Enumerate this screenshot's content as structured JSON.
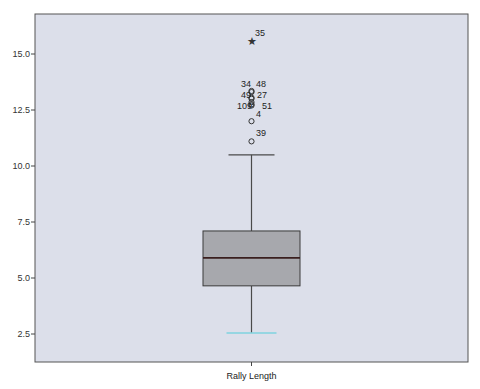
{
  "chart_data": {
    "type": "boxplot",
    "title": "",
    "xlabel": "",
    "ylabel": "",
    "categories": [
      "Rally Length"
    ],
    "ylim": [
      1.3,
      16.9
    ],
    "yticks": [
      2.5,
      5.0,
      7.5,
      10.0,
      12.5,
      15.0
    ],
    "ytick_labels": [
      "2.5",
      "5.0",
      "7.5",
      "10.0",
      "12.5",
      "15.0"
    ],
    "grid": false,
    "legend": null,
    "series": [
      {
        "name": "Rally Length",
        "whisker_low": 2.55,
        "q1": 4.65,
        "median": 5.9,
        "q3": 7.1,
        "whisker_high": 10.5,
        "outliers": [
          {
            "case": "39",
            "value": 11.1,
            "marker": "circle"
          },
          {
            "case": "4",
            "value": 12.0,
            "marker": "circle"
          },
          {
            "case": "109",
            "value": 12.7,
            "marker": "circle"
          },
          {
            "case": "51",
            "value": 12.75,
            "marker": "circle"
          },
          {
            "case": "",
            "value": 12.85,
            "marker": "circle"
          },
          {
            "case": "49",
            "value": 13.0,
            "marker": "circle"
          },
          {
            "case": "27",
            "value": 13.05,
            "marker": "circle"
          },
          {
            "case": "34",
            "value": 13.3,
            "marker": "circle"
          },
          {
            "case": "48",
            "value": 13.35,
            "marker": "circle"
          },
          {
            "case": "35",
            "value": 15.6,
            "marker": "star"
          }
        ]
      }
    ]
  },
  "colors": {
    "plot_background": "#dcdfea",
    "box_fill": "#a7a8ad",
    "box_stroke": "#3a3a3a",
    "median": "#3a1f1f",
    "whisker": "#4a4a4a",
    "lower_cap": "#7fd3df",
    "axis": "#444444"
  },
  "labels": {
    "x_category": "Rally Length"
  }
}
